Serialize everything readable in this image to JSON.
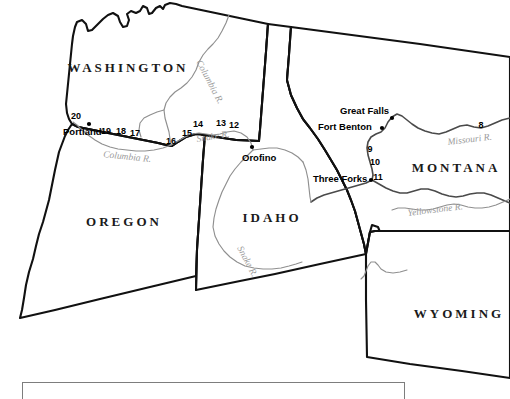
{
  "map": {
    "title": "Lewis and Clark Expedition Route Map",
    "background_color": "#ffffff",
    "states": [
      {
        "name": "WASHINGTON",
        "x": 128,
        "y": 72
      },
      {
        "name": "OREGON",
        "x": 124,
        "y": 226
      },
      {
        "name": "IDAHO",
        "x": 272,
        "y": 222
      },
      {
        "name": "MONTANA",
        "x": 456,
        "y": 172
      },
      {
        "name": "WYOMING",
        "x": 459,
        "y": 318
      }
    ],
    "cities": [
      {
        "name": "Portland",
        "label_x": 63,
        "label_y": 135,
        "dot_x": 89,
        "dot_y": 124,
        "anchor": "start"
      },
      {
        "name": "Orofino",
        "label_x": 242,
        "label_y": 161,
        "dot_x": 252,
        "dot_y": 147,
        "anchor": "start"
      },
      {
        "name": "Great Falls",
        "label_x": 340,
        "label_y": 114,
        "dot_x": 392,
        "dot_y": 118,
        "anchor": "start"
      },
      {
        "name": "Fort Benton",
        "label_x": 318,
        "label_y": 130,
        "dot_x": 382,
        "dot_y": 128,
        "anchor": "start"
      },
      {
        "name": "Three Forks",
        "label_x": 313,
        "label_y": 182,
        "dot_x": 371,
        "dot_y": 180,
        "anchor": "start"
      }
    ],
    "rivers": [
      {
        "name": "Columbia R.",
        "x": 196,
        "y": 62,
        "rotate": 62
      },
      {
        "name": "Columbia R.",
        "x": 103,
        "y": 157,
        "rotate": 6
      },
      {
        "name": "Snake R.",
        "x": 197,
        "y": 142,
        "rotate": -9
      },
      {
        "name": "Snake R.",
        "x": 237,
        "y": 248,
        "rotate": 62
      },
      {
        "name": "Missouri R.",
        "x": 448,
        "y": 145,
        "rotate": -7
      },
      {
        "name": "Yellowstone R.",
        "x": 408,
        "y": 216,
        "rotate": -7
      }
    ],
    "route_markers": [
      {
        "number": "20",
        "x": 76,
        "y": 119
      },
      {
        "number": "19",
        "x": 106,
        "y": 134
      },
      {
        "number": "18",
        "x": 121,
        "y": 134
      },
      {
        "number": "17",
        "x": 135,
        "y": 136
      },
      {
        "number": "16",
        "x": 171,
        "y": 144
      },
      {
        "number": "15",
        "x": 187,
        "y": 136
      },
      {
        "number": "14",
        "x": 198,
        "y": 127
      },
      {
        "number": "13",
        "x": 221,
        "y": 126
      },
      {
        "number": "12",
        "x": 234,
        "y": 128
      },
      {
        "number": "11",
        "x": 378,
        "y": 180
      },
      {
        "number": "10",
        "x": 375,
        "y": 165
      },
      {
        "number": "9",
        "x": 370,
        "y": 152
      },
      {
        "number": "8",
        "x": 481,
        "y": 128
      }
    ],
    "legend": {
      "present": true,
      "text": ""
    }
  }
}
